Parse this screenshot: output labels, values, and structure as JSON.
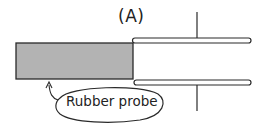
{
  "figure": {
    "panel_label": "(A)",
    "callout_label": "Rubber probe",
    "colors": {
      "probe_fill": "#b3b3b3",
      "stroke": "#2a2a2a",
      "background": "#ffffff"
    },
    "elements": [
      {
        "name": "rubber-probe",
        "type": "filled-rectangle"
      },
      {
        "name": "tube-upper-wall",
        "type": "thin-bar"
      },
      {
        "name": "tube-lower-wall",
        "type": "thin-bar"
      },
      {
        "name": "vertical-line",
        "type": "line"
      },
      {
        "name": "callout-bubble",
        "type": "ellipse-with-arrow"
      }
    ]
  }
}
